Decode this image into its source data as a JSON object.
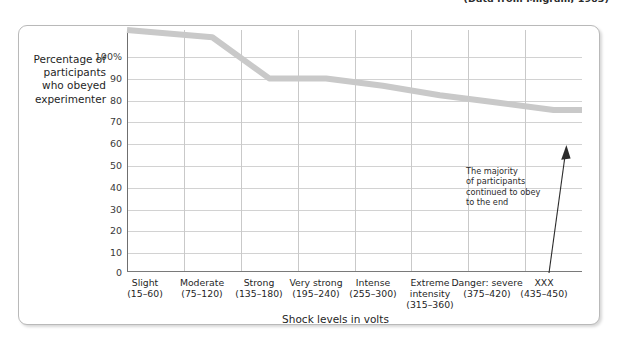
{
  "top_caption": "(Data from Milgram, 1963)",
  "chart_data": {
    "type": "line",
    "title": "",
    "xlabel": "Shock levels in volts",
    "ylabel": "Percentage of participants who obeyed experimenter",
    "ylabel_lines": [
      "Percentage of",
      "participants",
      "who obeyed",
      "experimenter"
    ],
    "categories": [
      "Slight",
      "Moderate",
      "Strong",
      "Very strong",
      "Intense",
      "Extreme intensity",
      "Danger: severe",
      "XXX"
    ],
    "category_labels": [
      {
        "name": "Slight",
        "range": "(15–60)"
      },
      {
        "name": "Moderate",
        "range": "(75–120)"
      },
      {
        "name": "Strong",
        "range": "(135–180)"
      },
      {
        "name": "Very strong",
        "range": "(195–240)"
      },
      {
        "name": "Intense",
        "range": "(255–300)"
      },
      {
        "name": "Extreme intensity",
        "range": "(315–360)"
      },
      {
        "name": "Danger: severe",
        "range": "(375–420)"
      },
      {
        "name": "XXX",
        "range": "(435–450)"
      }
    ],
    "values": [
      100,
      97,
      80,
      80,
      77,
      73,
      70,
      67
    ],
    "ylim": [
      0,
      100
    ],
    "yticks": [
      100,
      90,
      80,
      70,
      60,
      50,
      40,
      30,
      20,
      10,
      0
    ],
    "ytick_labels": [
      "100%",
      "90",
      "80",
      "70",
      "60",
      "50",
      "40",
      "30",
      "20",
      "10",
      "0"
    ],
    "grid": true,
    "legend": "none",
    "series_color": "#c9c9c9",
    "annotations": [
      {
        "text_lines": [
          "The majority",
          "of participants",
          "continued to obey",
          "to the end"
        ],
        "arrow": "up-right"
      }
    ]
  }
}
